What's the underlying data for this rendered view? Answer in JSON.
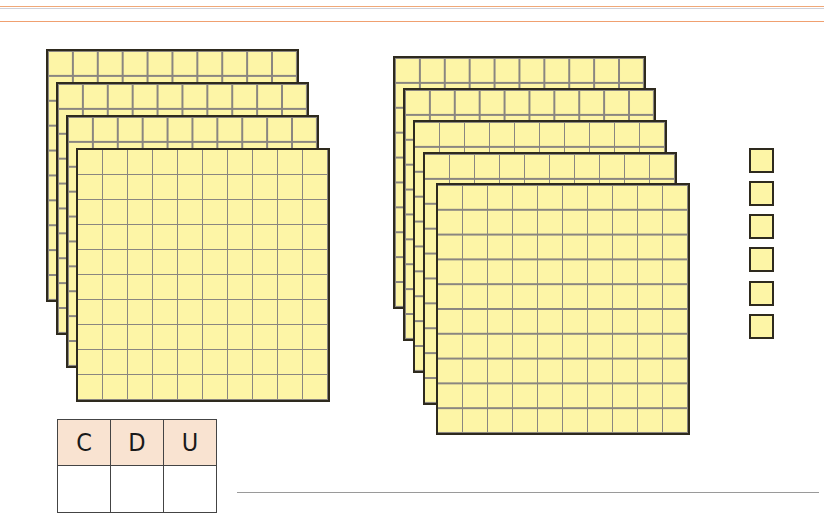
{
  "worksheet": {
    "rules": [
      {
        "y": 6,
        "color": "#f0a878"
      },
      {
        "y": 8,
        "color": "#d0d0d8"
      },
      {
        "y": 21,
        "color": "#f0a070"
      }
    ],
    "grid": {
      "rows": 10,
      "cols": 10,
      "fill": "#fdf5a6",
      "border": "#2e2a1e",
      "line": "#8a8680"
    },
    "groups": [
      {
        "name": "hundreds-group-left",
        "count": 4,
        "sheets": [
          {
            "x": 46,
            "y": 49,
            "w": 253,
            "h": 253
          },
          {
            "x": 56,
            "y": 82,
            "w": 253,
            "h": 253
          },
          {
            "x": 66,
            "y": 115,
            "w": 253,
            "h": 253
          },
          {
            "x": 76,
            "y": 148,
            "w": 254,
            "h": 254
          }
        ]
      },
      {
        "name": "hundreds-group-right",
        "count": 5,
        "sheets": [
          {
            "x": 393,
            "y": 56,
            "w": 253,
            "h": 253
          },
          {
            "x": 403,
            "y": 88,
            "w": 253,
            "h": 253
          },
          {
            "x": 413,
            "y": 120,
            "w": 254,
            "h": 253
          },
          {
            "x": 423,
            "y": 152,
            "w": 254,
            "h": 253
          },
          {
            "x": 436,
            "y": 183,
            "w": 254,
            "h": 252
          }
        ]
      }
    ],
    "units": {
      "count": 6,
      "x": 749,
      "tops": [
        148,
        181,
        214,
        247,
        281,
        314
      ]
    },
    "place_value_table": {
      "headers": [
        "C",
        "D",
        "U"
      ],
      "values": [
        "",
        "",
        ""
      ],
      "header_bg": "#f9e3d1"
    },
    "answer_line": {
      "value": ""
    }
  }
}
